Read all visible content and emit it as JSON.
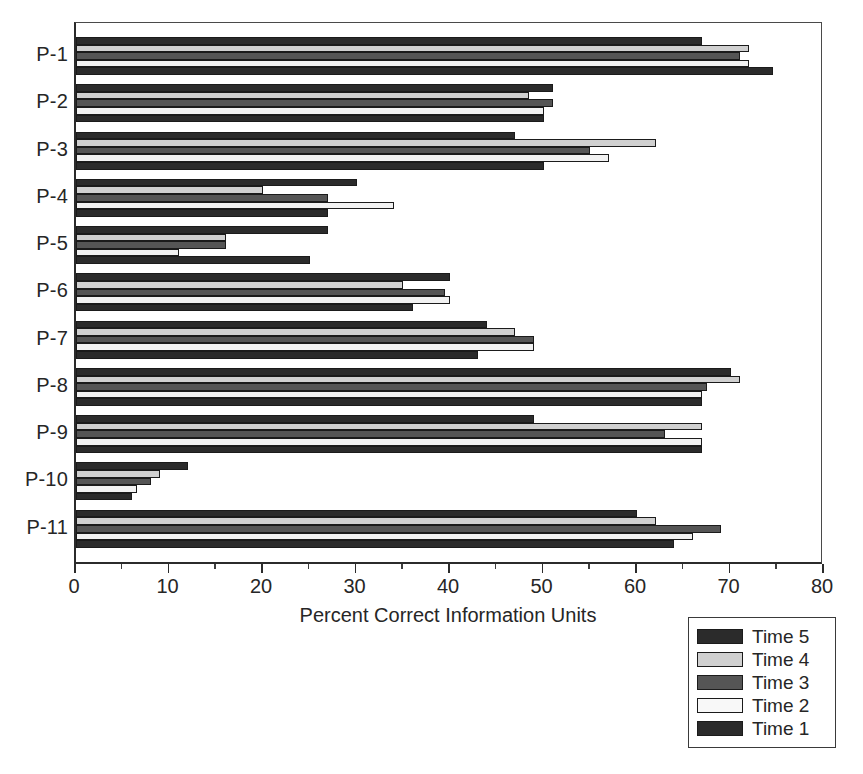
{
  "chart_data": {
    "type": "bar",
    "orientation": "horizontal",
    "title": "",
    "xlabel": "Percent Correct Information Units",
    "ylabel": "",
    "xlim": [
      0,
      80
    ],
    "xticks": [
      0,
      10,
      20,
      30,
      40,
      50,
      60,
      70,
      80
    ],
    "xtick_labels": [
      "0",
      "10",
      "20",
      "30",
      "40",
      "50",
      "60",
      "70",
      "80"
    ],
    "minor_tick_interval": 5,
    "grid": false,
    "legend_position": "bottom-right",
    "categories": [
      "P-1",
      "P-2",
      "P-3",
      "P-4",
      "P-5",
      "P-6",
      "P-7",
      "P-8",
      "P-9",
      "P-10",
      "P-11"
    ],
    "series": [
      {
        "name": "Time 5",
        "color": "#2b2b2b",
        "values": [
          67,
          51,
          47,
          30,
          27,
          40,
          44,
          70,
          49,
          12,
          60
        ]
      },
      {
        "name": "Time 4",
        "color": "#d0d0d0",
        "values": [
          72,
          48.5,
          62,
          20,
          16,
          35,
          47,
          71,
          67,
          9,
          62
        ]
      },
      {
        "name": "Time 3",
        "color": "#555555",
        "values": [
          71,
          51,
          55,
          27,
          16,
          39.5,
          49,
          67.5,
          63,
          8,
          69
        ]
      },
      {
        "name": "Time 2",
        "color": "#f2f2f2",
        "values": [
          72,
          50,
          57,
          34,
          11,
          40,
          49,
          67,
          67,
          6.5,
          66
        ]
      },
      {
        "name": "Time 1",
        "color": "#2b2b2b",
        "values": [
          74.5,
          50,
          50,
          27,
          25,
          36,
          43,
          67,
          67,
          6,
          64
        ]
      }
    ]
  },
  "legend": {
    "entries": [
      {
        "label": "Time 5",
        "color": "#2b2b2b"
      },
      {
        "label": "Time 4",
        "color": "#d0d0d0"
      },
      {
        "label": "Time 3",
        "color": "#555555"
      },
      {
        "label": "Time 2",
        "color": "#f8f8f8"
      },
      {
        "label": "Time 1",
        "color": "#2b2b2b"
      }
    ]
  }
}
